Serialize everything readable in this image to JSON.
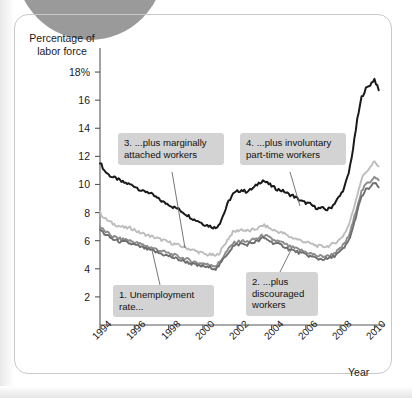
{
  "figure": {
    "y_axis_title": "Percentage of\nlabor force",
    "y_axis_title_line1": "Percentage of",
    "y_axis_title_line2": "labor force",
    "x_axis_title": "Year"
  },
  "callouts": [
    {
      "id": "callout-1",
      "line1": "1. Unemployment",
      "line2": "rate...",
      "text": "1. Unemployment rate..."
    },
    {
      "id": "callout-2",
      "line1": "2. ...plus",
      "line2": "discouraged",
      "line3": "workers",
      "text": "2. ...plus discouraged workers"
    },
    {
      "id": "callout-3",
      "line1": "3. ...plus marginally",
      "line2": "attached workers",
      "text": "3. ...plus marginally attached workers"
    },
    {
      "id": "callout-4",
      "line1": "4. ...plus involuntary",
      "line2": "part-time workers",
      "text": "4. ...plus involuntary part-time workers"
    }
  ],
  "colors": {
    "series_black": "#1a1a1a",
    "series_light_gray": "#bdbdbd",
    "series_mid_gray": "#8c8c8c",
    "series_dark_gray": "#6e6e6e",
    "axis": "#555555",
    "callout_bg": "#d3d3d3",
    "frame": "#c9c9c9",
    "blob": "#9a9a9a"
  },
  "chart_data": {
    "type": "line",
    "title": "",
    "subtitle": "",
    "xlabel": "Year",
    "ylabel": "Percentage of labor force",
    "xlim": [
      1994.0,
      2010.5
    ],
    "ylim": [
      0,
      19
    ],
    "grid": false,
    "legend": "annotations-inline",
    "ytick_labels": [
      "2",
      "4",
      "6",
      "8",
      "10",
      "12",
      "14",
      "16",
      "18%"
    ],
    "ytick_values": [
      2,
      4,
      6,
      8,
      10,
      12,
      14,
      16,
      18
    ],
    "xtick_labels": [
      "1994",
      "1996",
      "1998",
      "2000",
      "2002",
      "2004",
      "2006",
      "2008",
      "2010"
    ],
    "xtick_values": [
      1994,
      1996,
      1998,
      2000,
      2002,
      2004,
      2006,
      2008,
      2010
    ],
    "x": [
      1994.0,
      1994.25,
      1994.5,
      1994.75,
      1995.0,
      1995.25,
      1995.5,
      1995.75,
      1996.0,
      1996.25,
      1996.5,
      1996.75,
      1997.0,
      1997.25,
      1997.5,
      1997.75,
      1998.0,
      1998.25,
      1998.5,
      1998.75,
      1999.0,
      1999.25,
      1999.5,
      1999.75,
      2000.0,
      2000.25,
      2000.5,
      2000.75,
      2001.0,
      2001.25,
      2001.5,
      2001.75,
      2002.0,
      2002.25,
      2002.5,
      2002.75,
      2003.0,
      2003.25,
      2003.5,
      2003.75,
      2004.0,
      2004.25,
      2004.5,
      2004.75,
      2005.0,
      2005.25,
      2005.5,
      2005.75,
      2006.0,
      2006.25,
      2006.5,
      2006.75,
      2007.0,
      2007.25,
      2007.5,
      2007.75,
      2008.0,
      2008.25,
      2008.5,
      2008.75,
      2009.0,
      2009.25,
      2009.5,
      2009.75,
      2010.0,
      2010.25
    ],
    "series": [
      {
        "name": "4. ...plus involuntary part-time workers",
        "label_ref": "callout-4",
        "color": "#1a1a1a",
        "values": [
          11.6,
          11.0,
          10.7,
          10.5,
          10.4,
          10.2,
          10.1,
          10.0,
          9.9,
          9.7,
          9.5,
          9.5,
          9.3,
          9.1,
          8.9,
          8.7,
          8.6,
          8.4,
          8.3,
          8.1,
          7.9,
          7.7,
          7.5,
          7.4,
          7.2,
          7.1,
          7.0,
          6.9,
          7.3,
          8.0,
          8.8,
          9.3,
          9.5,
          9.6,
          9.5,
          9.6,
          9.8,
          10.1,
          10.3,
          10.1,
          9.9,
          9.7,
          9.6,
          9.5,
          9.3,
          9.2,
          9.0,
          8.8,
          8.7,
          8.6,
          8.4,
          8.3,
          8.3,
          8.2,
          8.4,
          8.8,
          9.2,
          9.8,
          10.8,
          12.5,
          14.6,
          16.2,
          16.8,
          17.1,
          17.5,
          16.7
        ]
      },
      {
        "name": "3. ...plus marginally attached workers",
        "label_ref": "callout-3",
        "color": "#bdbdbd",
        "values": [
          8.0,
          7.6,
          7.4,
          7.2,
          7.1,
          7.0,
          6.9,
          6.9,
          6.8,
          6.6,
          6.5,
          6.4,
          6.3,
          6.2,
          6.1,
          6.0,
          5.9,
          5.8,
          5.7,
          5.6,
          5.5,
          5.4,
          5.3,
          5.2,
          5.1,
          5.0,
          5.0,
          4.9,
          5.2,
          5.7,
          6.2,
          6.6,
          6.7,
          6.8,
          6.7,
          6.7,
          6.8,
          6.9,
          7.1,
          7.0,
          6.8,
          6.7,
          6.6,
          6.5,
          6.3,
          6.2,
          6.1,
          6.0,
          5.9,
          5.8,
          5.7,
          5.6,
          5.6,
          5.6,
          5.7,
          5.9,
          6.1,
          6.5,
          7.1,
          8.1,
          9.3,
          10.4,
          10.9,
          11.2,
          11.6,
          11.3
        ]
      },
      {
        "name": "2. ...plus discouraged workers",
        "label_ref": "callout-2",
        "color": "#8c8c8c",
        "values": [
          7.0,
          6.7,
          6.5,
          6.3,
          6.2,
          6.1,
          6.1,
          6.0,
          5.9,
          5.8,
          5.7,
          5.6,
          5.5,
          5.4,
          5.3,
          5.2,
          5.1,
          5.0,
          4.9,
          4.8,
          4.7,
          4.6,
          4.5,
          4.4,
          4.4,
          4.3,
          4.3,
          4.2,
          4.5,
          5.0,
          5.4,
          5.8,
          5.9,
          6.0,
          5.9,
          6.0,
          6.1,
          6.2,
          6.4,
          6.3,
          6.1,
          6.0,
          5.9,
          5.8,
          5.6,
          5.5,
          5.4,
          5.3,
          5.2,
          5.1,
          5.0,
          4.9,
          4.9,
          4.9,
          5.0,
          5.2,
          5.4,
          5.8,
          6.3,
          7.3,
          8.5,
          9.5,
          10.0,
          10.2,
          10.6,
          10.3
        ]
      },
      {
        "name": "1. Unemployment rate...",
        "label_ref": "callout-1",
        "color": "#6e6e6e",
        "values": [
          6.8,
          6.5,
          6.3,
          6.1,
          6.0,
          5.9,
          5.9,
          5.8,
          5.7,
          5.6,
          5.5,
          5.4,
          5.3,
          5.2,
          5.1,
          5.0,
          4.9,
          4.8,
          4.7,
          4.6,
          4.5,
          4.4,
          4.3,
          4.2,
          4.2,
          4.1,
          4.1,
          4.0,
          4.3,
          4.8,
          5.2,
          5.6,
          5.7,
          5.8,
          5.7,
          5.8,
          5.9,
          6.0,
          6.2,
          6.1,
          5.9,
          5.8,
          5.7,
          5.6,
          5.4,
          5.3,
          5.2,
          5.1,
          5.0,
          4.9,
          4.8,
          4.7,
          4.7,
          4.7,
          4.8,
          5.0,
          5.2,
          5.5,
          6.0,
          6.9,
          8.1,
          9.1,
          9.6,
          9.8,
          10.1,
          9.8
        ]
      }
    ]
  }
}
